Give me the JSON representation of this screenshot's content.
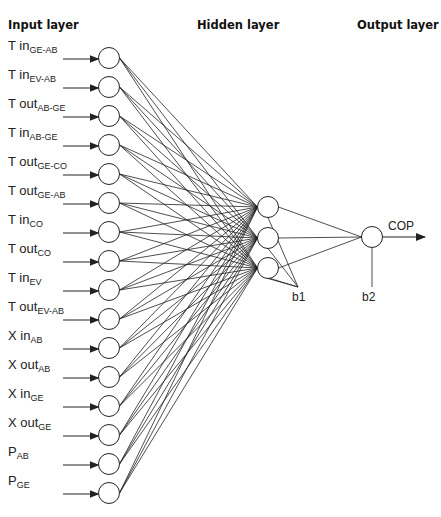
{
  "titles": {
    "input": "Input layer",
    "hidden": "Hidden layer",
    "output": "Output layer"
  },
  "inputs": [
    {
      "main": "T in",
      "sub": "GE-AB"
    },
    {
      "main": "T in",
      "sub": "EV-AB"
    },
    {
      "main": "T out",
      "sub": "AB-GE"
    },
    {
      "main": "T in",
      "sub": "AB-GE"
    },
    {
      "main": "T out",
      "sub": "GE-CO"
    },
    {
      "main": "T out",
      "sub": "GE-AB"
    },
    {
      "main": "T in",
      "sub": "CO"
    },
    {
      "main": "T out",
      "sub": "CO"
    },
    {
      "main": "T in",
      "sub": "EV"
    },
    {
      "main": "T out",
      "sub": "EV-AB"
    },
    {
      "main": "X in",
      "sub": "AB"
    },
    {
      "main": "X out",
      "sub": "AB"
    },
    {
      "main": "X in",
      "sub": "GE"
    },
    {
      "main": "X out",
      "sub": "GE"
    },
    {
      "main": "P",
      "sub": "AB"
    },
    {
      "main": "P",
      "sub": "GE"
    }
  ],
  "hidden_neurons": 3,
  "output": {
    "label": "COP"
  },
  "bias": {
    "hidden": "b1",
    "output": "b2"
  },
  "colors": {
    "line": "#222222",
    "node_fill": "#ffffff"
  }
}
